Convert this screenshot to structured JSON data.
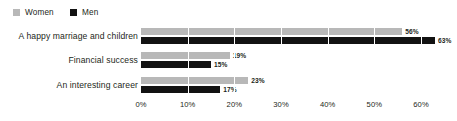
{
  "legend": {
    "items": [
      {
        "label": "Women",
        "color": "#b8b8b8",
        "swatch": "square-icon"
      },
      {
        "label": "Men",
        "color": "#121212",
        "swatch": "square-icon"
      }
    ]
  },
  "axis": {
    "ticks": [
      "0%",
      "10%",
      "20%",
      "30%",
      "40%",
      "50%",
      "60%"
    ]
  },
  "groups": [
    {
      "category": "A happy marriage and children",
      "women": {
        "label": "56%",
        "value": 56
      },
      "men": {
        "label": "63%",
        "value": 63
      }
    },
    {
      "category": "Financial success",
      "women": {
        "label": "19%",
        "value": 19
      },
      "men": {
        "label": "15%",
        "value": 15
      }
    },
    {
      "category": "An interesting career",
      "women": {
        "label": "23%",
        "value": 23
      },
      "men": {
        "label": "17%",
        "value": 17
      }
    }
  ],
  "chart_data": {
    "type": "bar",
    "orientation": "horizontal",
    "grouped": true,
    "title": "",
    "subtitle": "",
    "xlabel": "",
    "ylabel": "",
    "categories": [
      "A happy marriage and children",
      "Financial success",
      "An interesting career"
    ],
    "series": [
      {
        "name": "Women",
        "color": "#b8b8b8",
        "values": [
          56,
          19,
          23
        ]
      },
      {
        "name": "Men",
        "color": "#121212",
        "values": [
          63,
          15,
          17
        ]
      }
    ],
    "data_labels": [
      {
        "category": "A happy marriage and children",
        "Women": "56%",
        "Men": "63%"
      },
      {
        "category": "Financial success",
        "Women": "19%",
        "Men": "15%"
      },
      {
        "category": "An interesting career",
        "Women": "23%",
        "Men": "17%"
      }
    ],
    "xlim": [
      0,
      60
    ],
    "xticks": [
      0,
      10,
      20,
      30,
      40,
      50,
      60
    ],
    "xtick_labels": [
      "0%",
      "10%",
      "20%",
      "30%",
      "40%",
      "50%",
      "60%"
    ],
    "grid": true,
    "grid_axis": "x",
    "grid_color": "#ffffff",
    "legend_position": "top-left",
    "background": "#ffffff",
    "value_unit": "percent"
  }
}
